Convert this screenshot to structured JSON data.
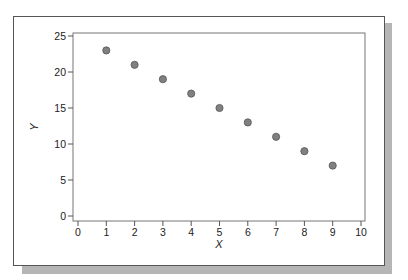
{
  "chart_data": {
    "type": "scatter",
    "title": "",
    "xlabel": "X",
    "ylabel": "Y",
    "xlim": [
      0,
      10
    ],
    "ylim": [
      0,
      25
    ],
    "x_ticks": [
      0,
      1,
      2,
      3,
      4,
      5,
      6,
      7,
      8,
      9,
      10
    ],
    "y_ticks": [
      0,
      5,
      10,
      15,
      20,
      25
    ],
    "grid": false,
    "legend": null,
    "series": [
      {
        "name": "data",
        "x": [
          1,
          2,
          3,
          4,
          5,
          6,
          7,
          8,
          9
        ],
        "y": [
          23,
          21,
          19,
          17,
          15,
          13,
          11,
          9,
          7
        ],
        "marker_color": "#808080",
        "marker_edge": "#555555"
      }
    ]
  }
}
